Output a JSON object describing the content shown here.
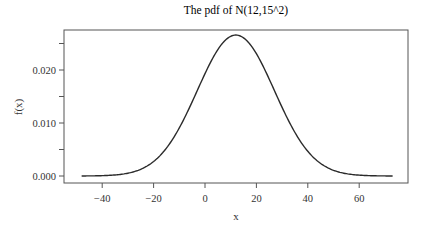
{
  "chart_data": {
    "type": "line",
    "title": "The pdf of N(12,15^2)",
    "xlabel": "x",
    "ylabel": "f(x)",
    "distribution": {
      "name": "normal",
      "mean": 12,
      "sd": 15
    },
    "xlim": [
      -48,
      73
    ],
    "ylim": [
      0,
      0.027
    ],
    "x_ticks": [
      -40,
      -20,
      0,
      20,
      40,
      60
    ],
    "x_tick_labels": [
      "−40",
      "−20",
      "0",
      "20",
      "40",
      "60"
    ],
    "y_ticks": [
      0.0,
      0.005,
      0.01,
      0.015,
      0.02,
      0.025
    ],
    "y_tick_labels": [
      "0.000",
      "",
      "0.010",
      "",
      "0.020",
      ""
    ],
    "grid": false,
    "legend": null,
    "series": [
      {
        "name": "f(x)",
        "x": [
          -48,
          -40,
          -32,
          -24,
          -16,
          -8,
          0,
          4,
          8,
          12,
          16,
          20,
          24,
          32,
          40,
          48,
          56,
          64,
          73
        ],
        "values": [
          9e-05,
          0.00031,
          0.00085,
          0.00198,
          0.00464,
          0.00874,
          0.013,
          0.0154,
          0.0256,
          0.0266,
          0.0256,
          0.023,
          0.0193,
          0.011,
          0.00464,
          0.00198,
          0.00085,
          0.00031,
          7e-05
        ]
      }
    ],
    "line_color": "#2b2b2b"
  }
}
